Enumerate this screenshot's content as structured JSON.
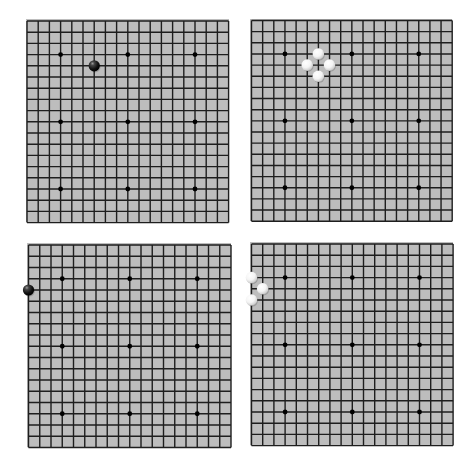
{
  "board_size": 19,
  "colors": {
    "board": "#bdbdbd",
    "line": "#1e1e1e",
    "star": "#000000",
    "black_stone": "#111111",
    "white_stone": "#f4f4f4"
  },
  "star_points": [
    [
      3,
      3
    ],
    [
      9,
      3
    ],
    [
      15,
      3
    ],
    [
      3,
      9
    ],
    [
      9,
      9
    ],
    [
      15,
      9
    ],
    [
      3,
      15
    ],
    [
      9,
      15
    ],
    [
      15,
      15
    ]
  ],
  "boards": [
    {
      "id": "top-left",
      "x": 26,
      "y": 19,
      "size": 203,
      "origin_x": 27,
      "origin_y": 21,
      "spacing": 11.2,
      "stones": [
        {
          "color": "black",
          "col": 6,
          "row": 4
        }
      ]
    },
    {
      "id": "top-right",
      "x": 250,
      "y": 19,
      "size": 202,
      "origin_x": 251.5,
      "origin_y": 20.5,
      "spacing": 11.15,
      "stones": [
        {
          "color": "white",
          "col": 6,
          "row": 3
        },
        {
          "color": "white",
          "col": 5,
          "row": 4
        },
        {
          "color": "white",
          "col": 7,
          "row": 4
        },
        {
          "color": "white",
          "col": 6,
          "row": 5
        }
      ]
    },
    {
      "id": "bottom-left",
      "x": 27,
      "y": 243,
      "size": 204,
      "origin_x": 28.5,
      "origin_y": 245,
      "spacing": 11.25,
      "stones": [
        {
          "color": "black",
          "col": 0,
          "row": 4
        }
      ]
    },
    {
      "id": "bottom-right",
      "x": 250,
      "y": 242,
      "size": 203,
      "origin_x": 251.5,
      "origin_y": 244,
      "spacing": 11.2,
      "stones": [
        {
          "color": "white",
          "col": 0,
          "row": 3
        },
        {
          "color": "white",
          "col": 1,
          "row": 4
        },
        {
          "color": "white",
          "col": 0,
          "row": 5
        }
      ]
    }
  ]
}
